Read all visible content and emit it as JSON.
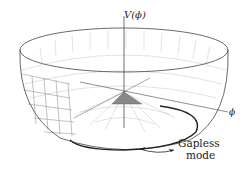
{
  "diagram": {
    "axis_vertical_label": "V(ϕ)",
    "axis_horizontal_label": "ϕ",
    "annotation_line1": "Gapless",
    "annotation_line2": "mode",
    "colors": {
      "line": "#333333",
      "grid": "#b8b8b8",
      "background": "#ffffff"
    }
  }
}
